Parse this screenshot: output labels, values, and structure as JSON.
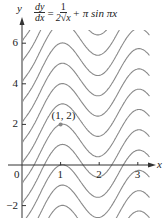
{
  "chart_data": {
    "type": "line",
    "equation": {
      "lhs_num": "dy",
      "lhs_den": "dx",
      "eq_sign": "=",
      "rhs_num": "1",
      "rhs_den": "2√x",
      "rhs_rest": "+ π sin πx"
    },
    "family": "y = √x − cos(πx) + C",
    "C_values": [
      -5,
      -4,
      -3,
      -2,
      -1,
      0,
      1,
      2,
      3,
      4,
      5,
      6,
      7
    ],
    "xlabel": "x",
    "ylabel": "y",
    "xlim": [
      0,
      3.3
    ],
    "ylim": [
      -2.6,
      6.6
    ],
    "x_ticks": [
      0,
      1,
      2,
      3
    ],
    "x_tick_labels": [
      "0",
      "1",
      "2",
      "3"
    ],
    "y_ticks": [
      -2,
      2,
      4,
      6
    ],
    "y_tick_labels": [
      "−2",
      "2",
      "4",
      "6"
    ],
    "highlighted_point": {
      "x": 1,
      "y": 2,
      "label": "(1, 2)"
    },
    "grid": false,
    "legend": "none"
  }
}
